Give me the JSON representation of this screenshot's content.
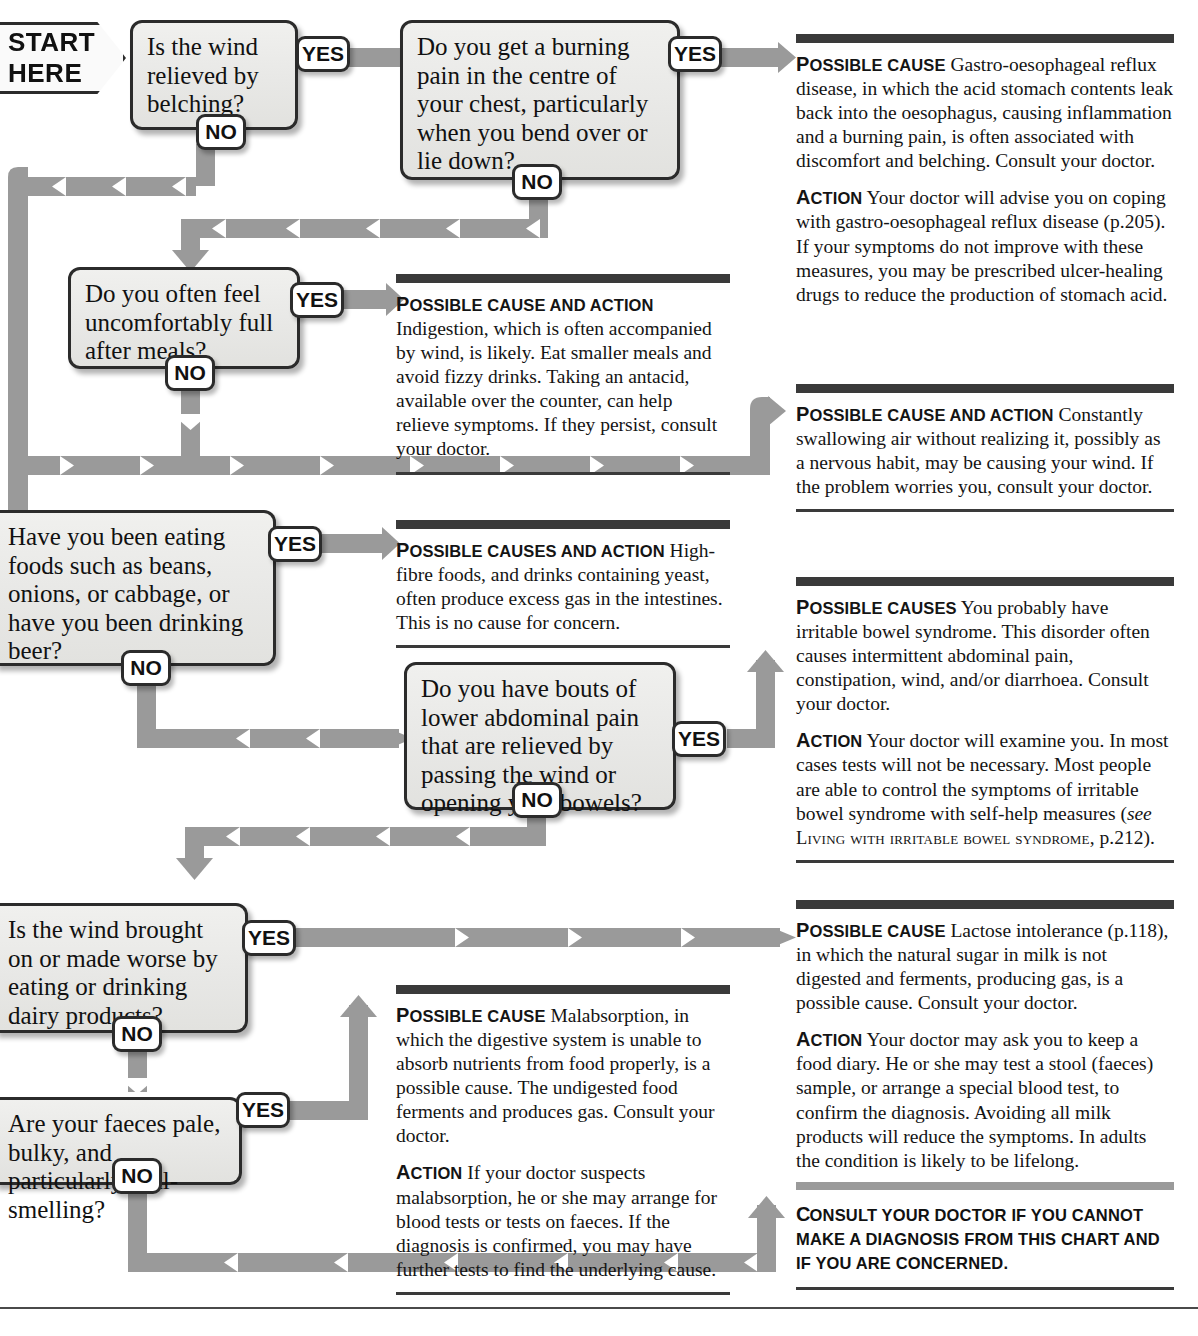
{
  "chart_title": "Wind symptom decision chart",
  "colors": {
    "arrow": "#9a9a9a",
    "box_border": "#2b2b2b",
    "box_fill": "#eaeae8",
    "rule_dark": "#3a3a3a",
    "rule_light": "#9a9a9a"
  },
  "start": {
    "line1": "START",
    "line2": "HERE"
  },
  "tags": {
    "yes": "YES",
    "no": "NO"
  },
  "questions": [
    {
      "id": "q1",
      "text": "Is the wind relieved by belching?"
    },
    {
      "id": "q2",
      "text": "Do you get a burning pain in the centre of your chest, particularly when you bend over or lie down?"
    },
    {
      "id": "q3",
      "text": "Do you often feel uncomfortably full after meals?"
    },
    {
      "id": "q4",
      "text": "Have you been eating foods such as beans, onions, or cabbage, or have you been drinking beer?"
    },
    {
      "id": "q5",
      "text": "Do you have bouts of lower abdominal pain that are relieved by passing the wind or opening your bowels?"
    },
    {
      "id": "q6",
      "text": "Is the wind brought on or made worse by eating or drinking dairy products?"
    },
    {
      "id": "q7",
      "text": "Are your faeces pale, bulky, and particularly foul-smelling?"
    }
  ],
  "panels": {
    "reflux": {
      "cause_label": "Possible cause",
      "cause_text": "Gastro-oesophageal reflux disease, in which the acid stomach contents leak back into the oesophagus, causing inflammation and a burning pain, is often associated with discomfort and belching. Consult your doctor.",
      "action_label": "Action",
      "action_text": "Your doctor will advise you on coping with gastro-oesophageal reflux disease (p.205). If your symptoms do not improve with these measures, you may be prescribed ulcer-healing drugs to reduce the production of stomach acid."
    },
    "indigestion": {
      "cause_label": "Possible cause and action",
      "cause_text": "Indigestion, which is often accompanied by wind, is likely. Eat smaller meals and avoid fizzy drinks. Taking an antacid, available over the counter, can help relieve symptoms. If they persist, consult your doctor."
    },
    "swallowing_air": {
      "cause_label": "Possible cause and action",
      "cause_text": "Constantly swallowing air without realizing it, possibly as a nervous habit, may be causing your wind. If the problem worries you, consult your doctor."
    },
    "high_fibre": {
      "cause_label": "Possible causes and action",
      "cause_text": "High-fibre foods, and drinks containing yeast, often produce excess gas in the intestines. This is no cause for concern."
    },
    "ibs": {
      "cause_label": "Possible causes",
      "cause_text": "You probably have irritable bowel syndrome. This disorder often causes intermittent abdominal pain, constipation, wind, and/or diarrhoea. Consult your doctor.",
      "action_label": "Action",
      "action_text_a": "Your doctor will examine you. In most cases tests will not be necessary. Most people are able to control the symptoms of irritable bowel syndrome with self-help measures (",
      "action_see": "see",
      "action_ref": "Living with irritable bowel syndrome",
      "action_text_b": ", p.212)."
    },
    "lactose": {
      "cause_label": "Possible cause",
      "cause_text": "Lactose intolerance (p.118), in which the natural sugar in milk is not digested and ferments, producing gas, is a possible cause. Consult your doctor.",
      "action_label": "Action",
      "action_text": "Your doctor may ask you to keep a food diary. He or she may test a stool (faeces) sample, or arrange a special blood test, to confirm the diagnosis. Avoiding all milk products will reduce the symptoms. In adults the condition is likely to be lifelong."
    },
    "malabsorption": {
      "cause_label": "Possible cause",
      "cause_text": "Malabsorption, in which the digestive system is unable to absorb nutrients from food properly, is a possible cause. The undigested food ferments and produces gas. Consult your doctor.",
      "action_label": "Action",
      "action_text": "If your doctor suspects malabsorption, he or she may arrange for blood tests or tests on faeces. If the diagnosis is confirmed, you may have further tests to find the underlying cause."
    },
    "consult": {
      "text": "Consult your doctor if you cannot make a diagnosis from this chart and if you are concerned."
    }
  }
}
